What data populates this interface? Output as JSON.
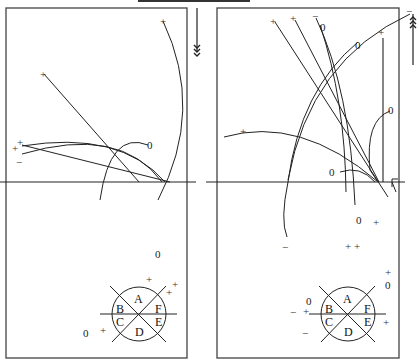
{
  "figure": {
    "top_bar": {
      "present": true
    },
    "left_panel": {
      "name": "left-panel",
      "arrow_direction": "down",
      "labels": {
        "zero_top": "0",
        "zero_bottom_right": "0",
        "zero_bottom_left": "0",
        "plus_marks": [
          "+",
          "+",
          "+",
          "+",
          "+",
          "+",
          "+",
          "+"
        ],
        "minus_mark": "−"
      },
      "compass": {
        "sectors": [
          "A",
          "B",
          "C",
          "D",
          "E",
          "F"
        ]
      }
    },
    "right_panel": {
      "name": "right-panel",
      "arrow_direction": "up",
      "labels": {
        "zeros": [
          "0",
          "0",
          "0",
          "0",
          "0",
          "0",
          "0"
        ],
        "plus_marks": [
          "+",
          "+",
          "+",
          "+",
          "+",
          "+",
          "+",
          "+",
          "+",
          "+"
        ],
        "minus_marks": [
          "−",
          "−",
          "−",
          "−"
        ]
      },
      "compass": {
        "sectors": [
          "A",
          "B",
          "C",
          "D",
          "E",
          "F"
        ]
      }
    }
  }
}
